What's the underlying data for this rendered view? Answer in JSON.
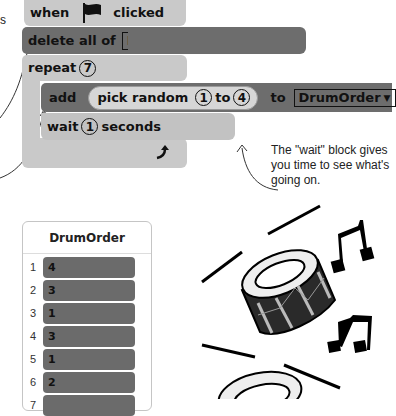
{
  "script": {
    "hat_block": {
      "when": "when",
      "flag_icon": "green-flag-icon",
      "clicked": "clicked"
    },
    "delete_block": {
      "label": "delete all of",
      "list": "DrumOrder"
    },
    "repeat_block": {
      "label": "repeat",
      "count": "7",
      "loop_icon": "loop-arrow-icon"
    },
    "add_block": {
      "label": "add",
      "reporter": "pick random",
      "from": "1",
      "to_word": "to",
      "to": "4",
      "to_label": "to",
      "list": "DrumOrder"
    },
    "wait_block": {
      "label": "wait",
      "value": "1",
      "unit": "seconds"
    }
  },
  "annotations": {
    "left_fragment": "s",
    "wait_note": "The \"wait\" block gives you time to see what's going on."
  },
  "list_monitor": {
    "title": "DrumOrder",
    "items": [
      {
        "index": "1",
        "value": "4"
      },
      {
        "index": "2",
        "value": "3"
      },
      {
        "index": "3",
        "value": "1"
      },
      {
        "index": "4",
        "value": "3"
      },
      {
        "index": "5",
        "value": "1"
      },
      {
        "index": "6",
        "value": "2"
      },
      {
        "index": "7",
        "value": ""
      }
    ]
  },
  "illustration": {
    "name": "drums-and-music-notes"
  },
  "colors": {
    "event": "#c9c9c9",
    "list_block": "#6d6d6d",
    "control": "#c9c9c9",
    "operator": "#d6d6d6",
    "cell": "#6b6b6b"
  }
}
